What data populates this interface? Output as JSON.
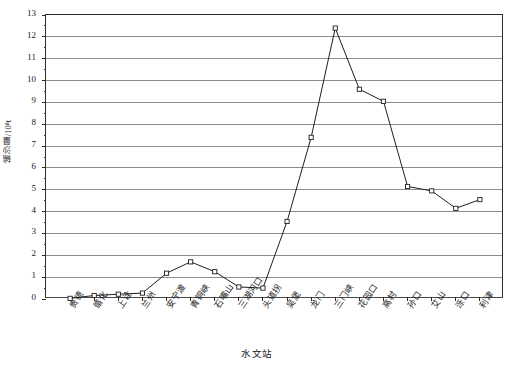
{
  "chart_data": {
    "type": "line",
    "title": "",
    "xlabel": "水文站",
    "ylabel": "输沙量/10⁸t",
    "ylabel_text": "输沙量",
    "ylabel_unit": "/10⁸t",
    "ylim": [
      0,
      13
    ],
    "ytick_step": 1,
    "yticks": [
      "0",
      "1",
      "2",
      "3",
      "4",
      "5",
      "6",
      "7",
      "8",
      "9",
      "10",
      "11",
      "12",
      "13"
    ],
    "grid": true,
    "grid_color": "#8d8d8d",
    "legend": null,
    "marker": "open-square",
    "line_color": "#1f1f1f",
    "categories": [
      "贵德",
      "循化",
      "上诠",
      "兰州",
      "安宁渡",
      "青铜峡",
      "石嘴山",
      "三湖河口",
      "头道拐",
      "吴堡",
      "龙门",
      "三门峡",
      "花园口",
      "高村",
      "孙口",
      "艾山",
      "泺口",
      "利津"
    ],
    "values": [
      0.03,
      0.16,
      0.22,
      0.27,
      1.18,
      1.7,
      1.25,
      0.55,
      0.5,
      3.55,
      7.4,
      12.4,
      9.6,
      9.05,
      5.15,
      4.95,
      4.15,
      4.55
    ]
  }
}
